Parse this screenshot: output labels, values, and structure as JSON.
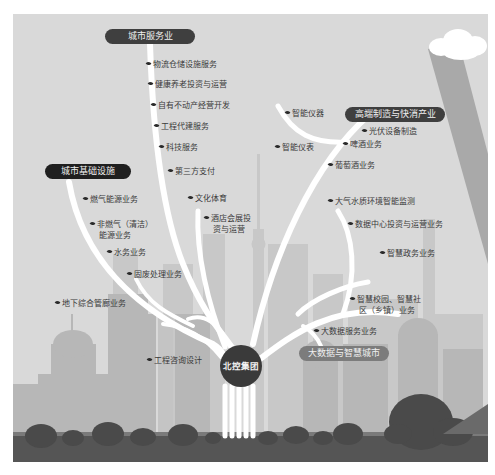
{
  "colors": {
    "background": "#d9d9d9",
    "building_light": "#c6c6c6",
    "building_mid": "#b4b4b4",
    "ground": "#555555",
    "bushes": "#4a4a4a",
    "pill_dark": "#3f3f3f",
    "pill_black": "#1f1f1f",
    "hub": "#3a3a3a",
    "branch": "#ffffff",
    "light_ray": "#a8a8a8"
  },
  "hub": {
    "label": "北控集团"
  },
  "categories": [
    {
      "id": "city-services",
      "label": "城市服务业"
    },
    {
      "id": "high-end-manufacturing",
      "label": "高端制造与快消产业"
    },
    {
      "id": "city-infrastructure",
      "label": "城市基础设施"
    },
    {
      "id": "big-data-smart-city",
      "label": "大数据与智慧城市"
    }
  ],
  "items": {
    "city_services": [
      "物流仓储设施服务",
      "健康养老投资与运营",
      "自有不动产经营开发",
      "工程代建服务",
      "科技服务",
      "第三方支付"
    ],
    "culture": [
      "文化体育"
    ],
    "hotel": {
      "line1": "酒店会展投",
      "line2": "资与运营"
    },
    "manufacturing": [
      "智能仪器",
      "光伏设备制造",
      "智能仪表",
      "啤酒业务",
      "葡萄酒业务"
    ],
    "infrastructure": [
      "燃气能源业务",
      "水务业务",
      "固废处理业务",
      "地下综合管廊业务"
    ],
    "non_gas": {
      "line1": "非燃气（清洁）",
      "line2": "能源业务"
    },
    "consulting": [
      "工程咨询设计"
    ],
    "smart_city": [
      "大气水质环境智能监测",
      "数据中心投资与运营业务",
      "智慧政务业务",
      "大数据服务业务"
    ],
    "smart_campus": {
      "line1": "智慧校园、智慧社",
      "line2": "区（乡镇）业务"
    }
  }
}
